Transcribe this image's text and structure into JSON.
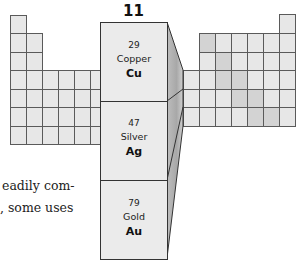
{
  "group": {
    "number": "11"
  },
  "elements": [
    {
      "atomic_number": "29",
      "name": "Copper",
      "symbol": "Cu"
    },
    {
      "atomic_number": "47",
      "name": "Silver",
      "symbol": "Ag"
    },
    {
      "atomic_number": "79",
      "name": "Gold",
      "symbol": "Au"
    }
  ],
  "text_fragment": {
    "line1": "eadily com-",
    "line2": ", some uses"
  },
  "colors": {
    "cell_light": "#e7e7e7",
    "cell_dark": "#d3d3d3",
    "grid_line": "#5a5a5a"
  }
}
